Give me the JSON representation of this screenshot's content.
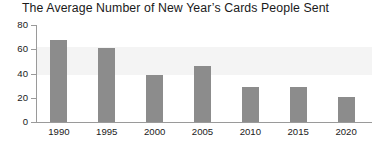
{
  "chart_data": {
    "type": "bar",
    "title": "The Average Number of New Year’s Cards People Sent",
    "xlabel": "",
    "ylabel": "",
    "categories": [
      "1990",
      "1995",
      "2000",
      "2005",
      "2010",
      "2015",
      "2020"
    ],
    "values": [
      68,
      61,
      39,
      46,
      29,
      29,
      21
    ],
    "yticks": [
      0,
      20,
      40,
      60,
      80
    ],
    "ylim": [
      0,
      80
    ],
    "grid": false,
    "legend": null,
    "series": [
      {
        "name": "Average number of New Year's cards sent",
        "values": [
          68,
          61,
          39,
          46,
          29,
          29,
          21
        ]
      }
    ],
    "colors": {
      "bar_fill": "#8c8c8c",
      "axis": "#9a9a9a",
      "text": "#1a1a1a",
      "background": "#ffffff",
      "band": "#f4f4f4"
    }
  }
}
